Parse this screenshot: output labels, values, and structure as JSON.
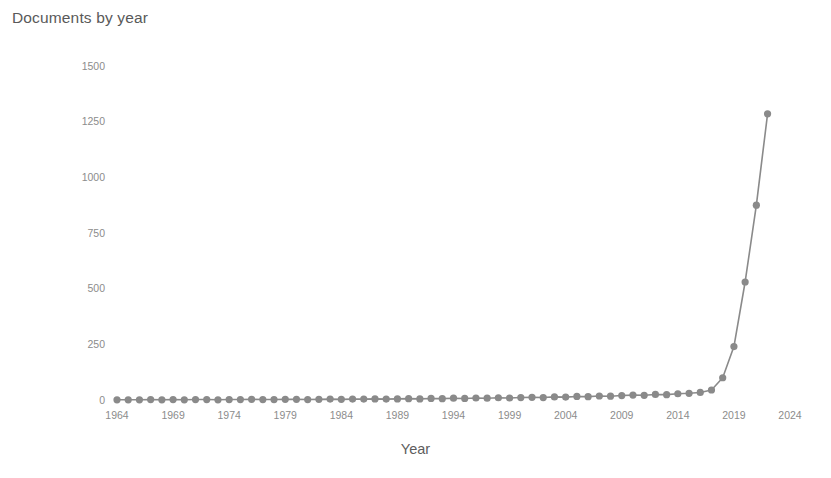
{
  "chart_data": {
    "type": "line",
    "title": "Documents by year",
    "xlabel": "Year",
    "ylabel": "Documents",
    "grid": false,
    "legend": "none",
    "series_color": "#8a8a8a",
    "marker": "circle",
    "xlim": [
      1963,
      2024.5
    ],
    "ylim": [
      0,
      1540
    ],
    "xtick_labels": [
      "1964",
      "1969",
      "1974",
      "1979",
      "1984",
      "1989",
      "1994",
      "1999",
      "2004",
      "2009",
      "2014",
      "2019",
      "2024"
    ],
    "xtick_values": [
      1964,
      1969,
      1974,
      1979,
      1984,
      1989,
      1994,
      1999,
      2004,
      2009,
      2014,
      2019,
      2024
    ],
    "ytick_labels": [
      "0",
      "250",
      "500",
      "750",
      "1000",
      "1250",
      "1500"
    ],
    "ytick_values": [
      0,
      250,
      500,
      750,
      1000,
      1250,
      1500
    ],
    "x": [
      1964,
      1965,
      1966,
      1967,
      1968,
      1969,
      1970,
      1971,
      1972,
      1973,
      1974,
      1975,
      1976,
      1977,
      1978,
      1979,
      1980,
      1981,
      1982,
      1983,
      1984,
      1985,
      1986,
      1987,
      1988,
      1989,
      1990,
      1991,
      1992,
      1993,
      1994,
      1995,
      1996,
      1997,
      1998,
      1999,
      2000,
      2001,
      2002,
      2003,
      2004,
      2005,
      2006,
      2007,
      2008,
      2009,
      2010,
      2011,
      2012,
      2013,
      2014,
      2015,
      2016,
      2017,
      2018,
      2019,
      2020,
      2021,
      2022
    ],
    "values": [
      1,
      1,
      1,
      2,
      1,
      2,
      1,
      2,
      2,
      1,
      2,
      2,
      3,
      2,
      2,
      3,
      3,
      2,
      3,
      4,
      3,
      4,
      4,
      5,
      4,
      5,
      6,
      5,
      7,
      6,
      8,
      7,
      9,
      8,
      10,
      9,
      11,
      12,
      11,
      14,
      13,
      16,
      15,
      18,
      17,
      20,
      22,
      21,
      25,
      24,
      28,
      30,
      34,
      45,
      100,
      240,
      530,
      875,
      1285
    ]
  }
}
